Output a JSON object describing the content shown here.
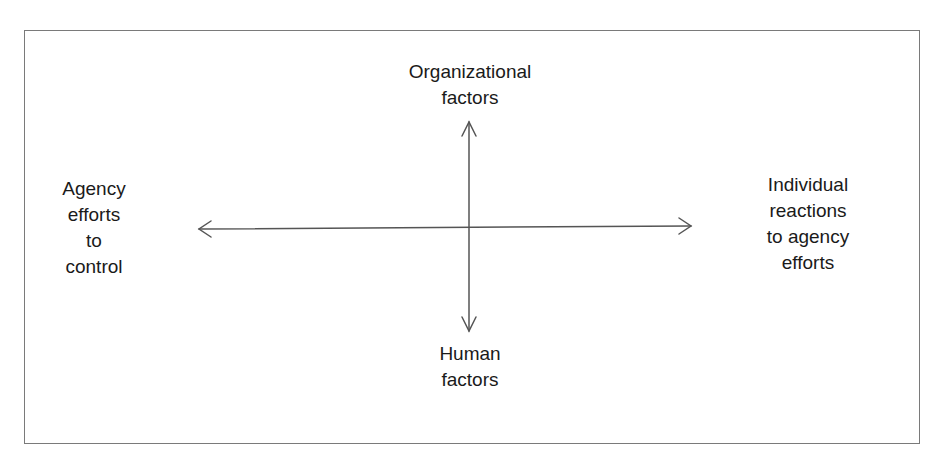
{
  "diagram": {
    "type": "quadrant-axes",
    "labels": {
      "top": [
        "Organizational",
        "factors"
      ],
      "bottom": [
        "Human",
        "factors"
      ],
      "left": [
        "Agency",
        "efforts",
        "to",
        "control"
      ],
      "right": [
        "Individual",
        "reactions",
        "to agency",
        "efforts"
      ]
    },
    "axes": {
      "horizontal": {
        "from": "Agency efforts to control",
        "to": "Individual reactions to agency efforts",
        "bidirectional": true
      },
      "vertical": {
        "from": "Organizational factors",
        "to": "Human factors",
        "bidirectional": true
      }
    },
    "colors": {
      "line": "#555555",
      "frame": "#7a7a7a",
      "text": "#1a1a1a"
    }
  }
}
